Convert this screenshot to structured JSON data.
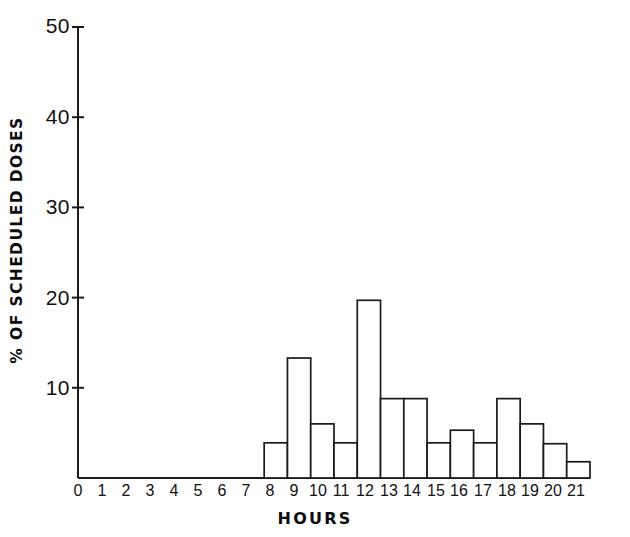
{
  "chart_data": {
    "type": "bar",
    "title": "",
    "subtitle": "",
    "xlabel": "HOURS",
    "ylabel": "% OF SCHEDULED DOSES",
    "categories": [
      "0",
      "1",
      "2",
      "3",
      "4",
      "5",
      "6",
      "7",
      "8",
      "9",
      "10",
      "11",
      "12",
      "13",
      "14",
      "15",
      "16",
      "17",
      "18",
      "19",
      "20",
      "21"
    ],
    "values": [
      0,
      0,
      0,
      0,
      0,
      0,
      0,
      0,
      3.9,
      13.3,
      6.0,
      3.9,
      19.7,
      8.8,
      8.8,
      3.9,
      5.3,
      3.9,
      8.8,
      6.0,
      3.8,
      1.8
    ],
    "series": [
      {
        "name": "% of scheduled doses",
        "values": [
          0,
          0,
          0,
          0,
          0,
          0,
          0,
          0,
          3.9,
          13.3,
          6.0,
          3.9,
          19.7,
          8.8,
          8.8,
          3.9,
          5.3,
          3.9,
          8.8,
          6.0,
          3.8,
          1.8
        ]
      }
    ],
    "xlim": [
      0,
      22
    ],
    "ylim": [
      0,
      50
    ],
    "ytick_labels": [
      "50",
      "40",
      "30",
      "20",
      "10"
    ],
    "ytick_values": [
      50,
      40,
      30,
      20,
      10
    ],
    "xtick_labels": [
      "0",
      "1",
      "2",
      "3",
      "4",
      "5",
      "6",
      "7",
      "8",
      "9",
      "10",
      "11",
      "12",
      "13",
      "14",
      "15",
      "16",
      "17",
      "18",
      "19",
      "20",
      "21"
    ],
    "grid": false,
    "legend": false,
    "legend_position": "none",
    "bar_fill": "#ffffff",
    "bar_edge": "#1a1a1a",
    "axis_color": "#1a1a1a",
    "background": "#ffffff",
    "annotations": []
  },
  "axis": {
    "y_title": "% OF SCHEDULED DOSES",
    "x_title": "HOURS"
  }
}
